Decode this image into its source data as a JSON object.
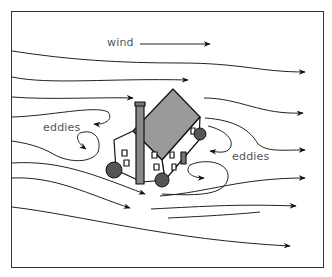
{
  "diagram": {
    "labels": {
      "wind": "wind",
      "eddies_left": "eddies",
      "eddies_right": "eddies"
    },
    "elements": [
      {
        "type": "house",
        "description": "two-story house with gray gable roof and chimney"
      },
      {
        "type": "shrubs",
        "count": 3
      },
      {
        "type": "wind-streamlines",
        "direction": "left-to-right"
      },
      {
        "type": "eddy",
        "position": "upwind-left of house"
      },
      {
        "type": "eddy",
        "position": "downwind-right of house"
      }
    ],
    "colors": {
      "line": "#222222",
      "roof": "#9a9a9a",
      "shrub": "#555555",
      "label": "#555555",
      "background": "#ffffff"
    }
  }
}
